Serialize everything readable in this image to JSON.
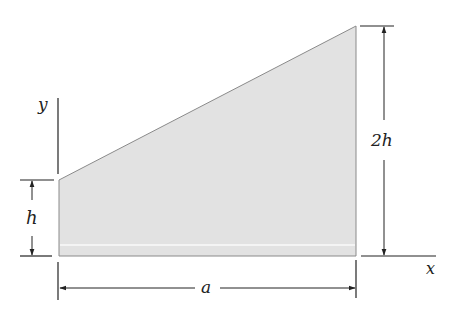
{
  "figure": {
    "type": "trapezoid-area",
    "fill_color": "#e2e2e2",
    "edge_color": "#8a8a8a",
    "line_color": "#222222",
    "vertices": {
      "bottom_left": [
        59,
        256
      ],
      "bottom_right": [
        356,
        256
      ],
      "top_right": [
        356,
        26
      ],
      "top_left": [
        59,
        180
      ]
    }
  },
  "axes": {
    "x_label": "x",
    "y_label": "y"
  },
  "dimensions": {
    "left_height": "h",
    "right_height": "2h",
    "width": "a"
  }
}
